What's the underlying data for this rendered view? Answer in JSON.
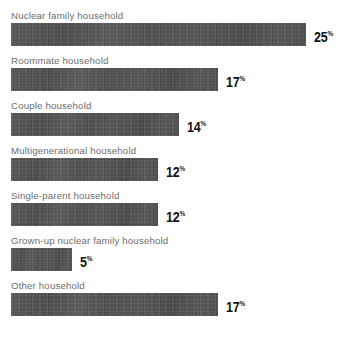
{
  "chart_data": {
    "type": "bar",
    "orientation": "horizontal",
    "title": "",
    "xlabel": "",
    "ylabel": "",
    "unit": "%",
    "grid": false,
    "legend": null,
    "xlim": [
      0,
      25
    ],
    "categories": [
      "Nuclear family household",
      "Roommate household",
      "Couple household",
      "Multigenerational household",
      "Single-parent household",
      "Grown-up nuclear family household",
      "Other household"
    ],
    "values": [
      25,
      17,
      14,
      12,
      12,
      5,
      17
    ],
    "value_labels": [
      "25",
      "17",
      "14",
      "12",
      "12",
      "5",
      "17"
    ],
    "colors": {
      "bar": "#4f4f4f",
      "label": "#6d6d6d",
      "value": "#121212",
      "background": "#ffffff"
    },
    "bars": [
      {
        "label": "Nuclear family household",
        "value": 25,
        "value_label": "25",
        "unit": "%",
        "width_px": 295
      },
      {
        "label": "Roommate household",
        "value": 17,
        "value_label": "17",
        "unit": "%",
        "width_px": 207
      },
      {
        "label": "Couple household",
        "value": 14,
        "value_label": "14",
        "unit": "%",
        "width_px": 168
      },
      {
        "label": "Multigenerational household",
        "value": 12,
        "value_label": "12",
        "unit": "%",
        "width_px": 147
      },
      {
        "label": "Single-parent household",
        "value": 12,
        "value_label": "12",
        "unit": "%",
        "width_px": 147
      },
      {
        "label": "Grown-up nuclear family household",
        "value": 5,
        "value_label": "5",
        "unit": "%",
        "width_px": 61
      },
      {
        "label": "Other household",
        "value": 17,
        "value_label": "17",
        "unit": "%",
        "width_px": 207
      }
    ]
  }
}
